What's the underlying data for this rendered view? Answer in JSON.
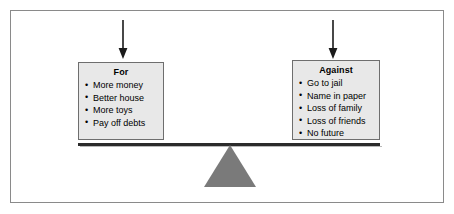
{
  "figure": {
    "fulcrum_color": "#7a7a7a",
    "beam_color": "#2b2b2b",
    "panel_fill": "#e8e8e8",
    "panel_border": "#6e6e6e",
    "frame_border": "#8a8a8a"
  },
  "arrows": {
    "left": {
      "name": "down-arrow-to-for-panel"
    },
    "right": {
      "name": "down-arrow-to-against-panel"
    }
  },
  "panels": {
    "for": {
      "title": "For",
      "items": [
        "More money",
        "Better house",
        "More toys",
        "Pay off debts"
      ]
    },
    "against": {
      "title": "Against",
      "items": [
        "Go to jail",
        "Name in paper",
        "Loss of family",
        "Loss of friends",
        "No future"
      ]
    }
  }
}
